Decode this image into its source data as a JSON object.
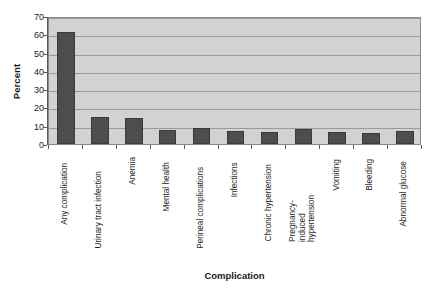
{
  "chart_data": {
    "type": "bar",
    "title": "",
    "xlabel": "Complication",
    "ylabel": "Percent",
    "ylim": [
      0,
      70
    ],
    "ytick_step": 10,
    "yticks": [
      70,
      60,
      50,
      40,
      30,
      20,
      10,
      0
    ],
    "grid": true,
    "legend": false,
    "categories": [
      "Any complication",
      "Urinary tract infection",
      "Anemia",
      "Mental health",
      "Perineal complications",
      "Infections",
      "Chronic hypertension",
      "Pregnancy-induced hypertension",
      "Vomiting",
      "Bleeding",
      "Abnormal glucose"
    ],
    "values": [
      61,
      15,
      14,
      7.5,
      9,
      7,
      6.5,
      8,
      6.5,
      6,
      7
    ],
    "colors": {
      "bar": "#4d4d4d",
      "bar_border": "#3a3a3a",
      "plot_background": "#d2d2d2",
      "gridline": "#9a9a9a",
      "axis": "#5a5a5a",
      "text": "#1a1a1a",
      "page_background": "#ffffff"
    }
  }
}
